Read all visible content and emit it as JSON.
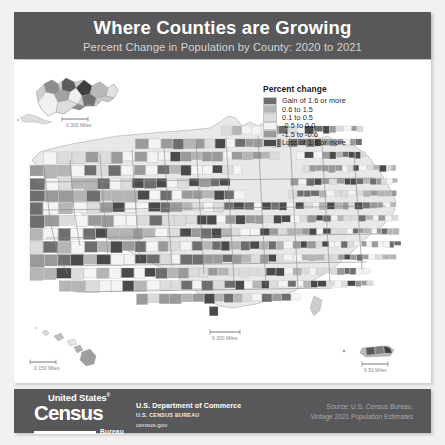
{
  "header": {
    "title": "Where Counties are Growing",
    "subtitle": "Percent Change in Population by County: 2020 to 2021"
  },
  "legend": {
    "title": "Percent change",
    "items": [
      {
        "label": "Gain of 1.6 or more",
        "color": "#6e6e6e"
      },
      {
        "label": "0.6 to 1.5",
        "color": "#b5b5b5"
      },
      {
        "label": "0.1 to 0.5",
        "color": "#dcdcdc"
      },
      {
        "label": "-0.5 to 0.0",
        "color": "#f4f4f4"
      },
      {
        "label": "-1.5 to -0.6",
        "color": "#9a9a9a"
      },
      {
        "label": "Loss of 1.6 or more",
        "color": "#4a4a4a"
      }
    ]
  },
  "map": {
    "insets": [
      {
        "name": "alaska",
        "scale_text": "0      300 Miles"
      },
      {
        "name": "hawaii",
        "scale_text": "0      150 Miles"
      },
      {
        "name": "puerto-rico",
        "scale_text": "0       50 Miles"
      },
      {
        "name": "main",
        "scale_text": "0      300 Miles"
      }
    ]
  },
  "footer": {
    "logo": {
      "united_states": "United States",
      "registered": "®",
      "census": "Census",
      "bureau": "Bureau"
    },
    "agency": {
      "line1": "U.S. Department of Commerce",
      "line2": "U.S. CENSUS BUREAU",
      "line3": "census.gov"
    },
    "source": {
      "line1": "Source: U.S. Census Bureau,",
      "line2": "Vintage 2021 Population Estimates"
    }
  },
  "chart_data": {
    "type": "heatmap",
    "title": "Where Counties are Growing",
    "subtitle": "Percent Change in Population by County: 2020 to 2021",
    "xlabel": "",
    "ylabel": "",
    "legend_position": "top-right",
    "grid": false,
    "categories": [
      "Gain of 1.6 or more",
      "0.6 to 1.5",
      "0.1 to 0.5",
      "-0.5 to 0.0",
      "-1.5 to -0.6",
      "Loss of 1.6 or more"
    ],
    "bin_ranges": [
      [
        1.6,
        null
      ],
      [
        0.6,
        1.5
      ],
      [
        0.1,
        0.5
      ],
      [
        -0.5,
        0.0
      ],
      [
        -1.5,
        -0.6
      ],
      [
        null,
        -1.6
      ]
    ],
    "colors": [
      "#6e6e6e",
      "#b5b5b5",
      "#dcdcdc",
      "#f4f4f4",
      "#9a9a9a",
      "#4a4a4a"
    ],
    "units": "percent change in population",
    "geography": "United States counties",
    "period": "2020 to 2021"
  }
}
